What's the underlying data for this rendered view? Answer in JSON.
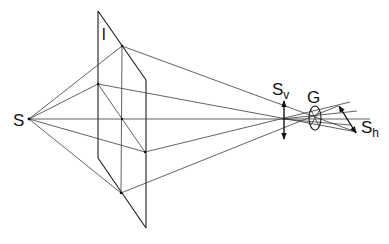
{
  "diagram": {
    "type": "perspective projection diagram",
    "labels": {
      "source": "S",
      "plane": "l",
      "vertical_size": "S",
      "vertical_sub": "v",
      "lens": "G",
      "horizontal_size": "S",
      "horizontal_sub": "h"
    },
    "points": {
      "S": [
        29,
        119
      ],
      "plane_top": [
        98,
        11
      ],
      "plane_left_bottom": [
        98,
        158
      ],
      "plane_right_top": [
        146,
        80
      ],
      "plane_bottom": [
        146,
        228
      ],
      "node_top": [
        122,
        46
      ],
      "node_left": [
        98,
        84
      ],
      "node_center": [
        122,
        119
      ],
      "node_right": [
        145,
        152
      ],
      "node_bottom": [
        121,
        193
      ],
      "focus": [
        282,
        119
      ],
      "lens_center": [
        315,
        118
      ]
    },
    "colors": {
      "line": "#3a3a3a",
      "background": "#ffffff"
    }
  }
}
